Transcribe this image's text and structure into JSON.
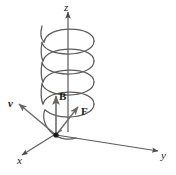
{
  "figure": {
    "kind": "physics-vector-diagram",
    "background_color": "#ffffff",
    "stroke_color": "#555555",
    "axis_color": "#4a4a4a",
    "label_color": "#1a1a1a",
    "origin_dot_color": "#1a1a1a",
    "width": 176,
    "height": 175
  },
  "axes": [
    {
      "id": "z",
      "label": "z",
      "label_x": 64,
      "label_y": 3
    },
    {
      "id": "y",
      "label": "y",
      "label_x": 161,
      "label_y": 152
    },
    {
      "id": "x",
      "label": "x",
      "label_x": 18,
      "label_y": 157
    }
  ],
  "vectors": [
    {
      "id": "B",
      "label": "B",
      "label_x": 60,
      "label_y": 92,
      "direction": "up-along-z"
    },
    {
      "id": "F",
      "label": "F",
      "label_x": 81,
      "label_y": 108,
      "direction": "up-right"
    },
    {
      "id": "v",
      "label": "v",
      "label_x": 9,
      "label_y": 100,
      "direction": "up-left"
    }
  ],
  "helix": {
    "turns": 3,
    "ellipse_rx": 26,
    "ellipse_ry": 9,
    "center_x": 68,
    "top_y": 36,
    "bottom_y": 122
  },
  "origin": {
    "x": 56,
    "y": 135,
    "dot_radius": 2.6
  }
}
